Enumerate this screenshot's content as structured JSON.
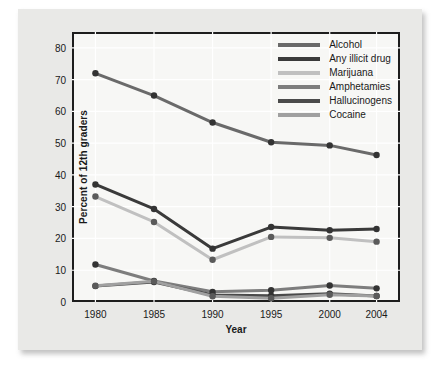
{
  "chart_data": {
    "type": "line",
    "title": "",
    "xlabel": "Year",
    "ylabel": "Percent of 12th graders",
    "categories": [
      "1980",
      "1985",
      "1990",
      "1995",
      "2000",
      "2004"
    ],
    "x": [
      1980,
      1985,
      1990,
      1995,
      2000,
      2004
    ],
    "xlim": [
      1978,
      2006
    ],
    "ylim": [
      0,
      85
    ],
    "yticks": [
      0,
      10,
      20,
      30,
      40,
      50,
      60,
      70,
      80
    ],
    "grid": true,
    "legend_position": "top-right",
    "markers": "filled-circle",
    "series": [
      {
        "name": "Alcohol",
        "color": "#6a6a6a",
        "values": [
          72,
          65,
          56.5,
          50.3,
          49.3,
          46.3
        ]
      },
      {
        "name": "Any illicit drug",
        "color": "#3a3a3a",
        "values": [
          37,
          29.3,
          16.8,
          23.6,
          22.6,
          23
        ]
      },
      {
        "name": "Marijuana",
        "color": "#c0c0c0",
        "values": [
          33.2,
          25.2,
          13.3,
          20.5,
          20.2,
          19
        ]
      },
      {
        "name": "Amphetamies",
        "color": "#7d7d7d",
        "values": [
          11.8,
          6.6,
          3.2,
          3.7,
          5.2,
          4.3
        ]
      },
      {
        "name": "Hallucinogens",
        "color": "#4a4a4a",
        "values": [
          5.0,
          6.3,
          2.2,
          2.0,
          2.6,
          1.9
        ]
      },
      {
        "name": "Cocaine",
        "color": "#a0a0a0",
        "values": [
          5.1,
          6.5,
          1.8,
          1.2,
          2.3,
          1.9
        ]
      }
    ]
  }
}
